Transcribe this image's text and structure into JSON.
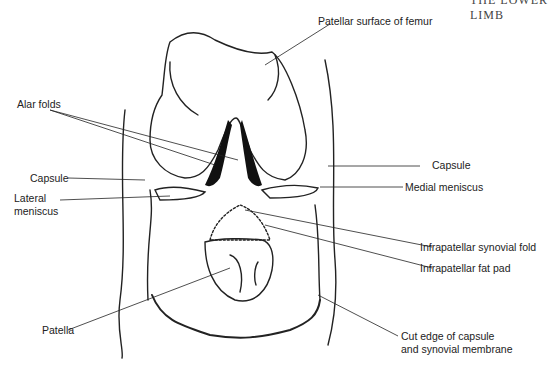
{
  "header": {
    "running_title": "THE LOWER LIMB"
  },
  "diagram": {
    "labels": {
      "patellar_surface": "Patellar surface of femur",
      "alar_folds": "Alar folds",
      "capsule_left": "Capsule",
      "lateral_meniscus_1": "Lateral",
      "lateral_meniscus_2": "meniscus",
      "capsule_right": "Capsule",
      "medial_meniscus": "Medial meniscus",
      "infrapatellar_synovial_fold": "Infrapatellar synovial fold",
      "infrapatellar_fat_pad": "Infrapatellar fat pad",
      "patella": "Patella",
      "cut_edge_1": "Cut edge of capsule",
      "cut_edge_2": "and synovial membrane"
    },
    "colors": {
      "line": "#222222",
      "background": "#ffffff"
    }
  }
}
